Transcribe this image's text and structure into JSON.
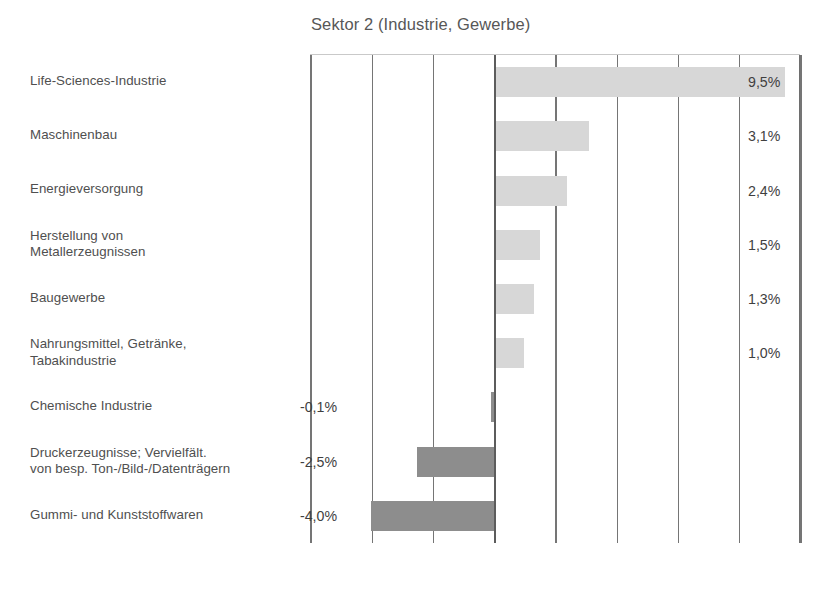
{
  "chart_data": {
    "type": "bar",
    "orientation": "horizontal",
    "title": "Sektor 2 (Industrie, Gewerbe)",
    "xlabel": "",
    "ylabel": "",
    "xlim": [
      -6.0,
      10.0
    ],
    "grid": true,
    "gridline_values": [
      -6,
      -4,
      -2,
      0,
      2,
      4,
      6,
      8,
      10
    ],
    "legend": "none",
    "value_suffix": "%",
    "decimal_separator": ",",
    "colors": {
      "positive_bar": "#d7d7d7",
      "negative_bar": "#8d8d8d",
      "axis": "#5c5c5c",
      "gridline": "#757575",
      "text": "#4f4f4f"
    },
    "categories": [
      "Life-Sciences-Industrie",
      "Maschinenbau",
      "Energieversorgung",
      "Herstellung von Metallerzeugnissen",
      "Baugewerbe",
      "Nahrungsmittel, Getränke, Tabakindustrie",
      "Chemische Industrie",
      "Druckerzeugnisse; Vervielfält. von besp. Ton-/Bild-/Datenträgern",
      "Gummi- und Kunststoffwaren"
    ],
    "values": [
      9.5,
      3.1,
      2.4,
      1.5,
      1.3,
      1.0,
      -0.1,
      -2.5,
      -4.0
    ],
    "value_labels": [
      "9,5%",
      "3,1%",
      "2,4%",
      "1,5%",
      "1,3%",
      "1,0%",
      "-0,1%",
      "-2,5%",
      "-4,0%"
    ]
  },
  "rows": [
    {
      "label_line1": "Life-Sciences-Industrie",
      "label_line2": "",
      "value_label": "9,5%",
      "sign": "pos"
    },
    {
      "label_line1": "Maschinenbau",
      "label_line2": "",
      "value_label": "3,1%",
      "sign": "pos"
    },
    {
      "label_line1": "Energieversorgung",
      "label_line2": "",
      "value_label": "2,4%",
      "sign": "pos"
    },
    {
      "label_line1": "Herstellung von",
      "label_line2": "Metallerzeugnissen",
      "value_label": "1,5%",
      "sign": "pos"
    },
    {
      "label_line1": "Baugewerbe",
      "label_line2": "",
      "value_label": "1,3%",
      "sign": "pos"
    },
    {
      "label_line1": "Nahrungsmittel, Getränke,",
      "label_line2": "Tabakindustrie",
      "value_label": "1,0%",
      "sign": "pos"
    },
    {
      "label_line1": "Chemische Industrie",
      "label_line2": "",
      "value_label": "-0,1%",
      "sign": "neg"
    },
    {
      "label_line1": "Druckerzeugnisse; Vervielfält.",
      "label_line2": "von besp. Ton-/Bild-/Datenträgern",
      "value_label": "-2,5%",
      "sign": "neg"
    },
    {
      "label_line1": "Gummi- und Kunststoffwaren",
      "label_line2": "",
      "value_label": "-4,0%",
      "sign": "neg"
    }
  ]
}
